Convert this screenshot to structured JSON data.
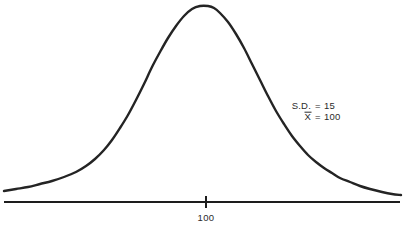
{
  "figure": {
    "ink_color": "#242424",
    "background_color": "#ffffff"
  },
  "annotations": {
    "sd_label": "S.D.",
    "sd_equals": "=",
    "sd_value": "15",
    "mean_symbol": "X",
    "mean_equals": "=",
    "mean_value": "100"
  },
  "axis": {
    "tick_label": "100"
  },
  "chart_data": {
    "type": "line",
    "xlabel": "",
    "ylabel": "",
    "grid": false,
    "legend": null,
    "annotations": [
      "S.D. = 15",
      "X̄ = 100"
    ],
    "axis_ticks": [
      {
        "label": "100",
        "x_px": 206
      }
    ],
    "mean": 100,
    "std_dev": 15,
    "xlim": [
      36,
      166
    ],
    "x": [
      36,
      42,
      48,
      54,
      60,
      66,
      72,
      76,
      80,
      84,
      88,
      91,
      94,
      97,
      100,
      103,
      106,
      109,
      112,
      116,
      120,
      124,
      128,
      134,
      140,
      146,
      152,
      158,
      166
    ],
    "values": [
      0.035,
      0.045,
      0.06,
      0.08,
      0.105,
      0.145,
      0.215,
      0.285,
      0.39,
      0.53,
      0.7,
      0.83,
      0.935,
      0.99,
      1.0,
      0.985,
      0.93,
      0.83,
      0.7,
      0.54,
      0.39,
      0.285,
      0.215,
      0.145,
      0.105,
      0.08,
      0.06,
      0.048,
      0.038
    ],
    "ylim": [
      0,
      1.05
    ],
    "curve_points_px": [
      [
        4,
        191
      ],
      [
        16,
        189
      ],
      [
        28,
        187
      ],
      [
        40,
        184
      ],
      [
        52,
        181
      ],
      [
        64,
        177
      ],
      [
        76,
        172
      ],
      [
        86,
        166
      ],
      [
        95,
        159
      ],
      [
        104,
        150
      ],
      [
        112,
        140
      ],
      [
        120,
        128
      ],
      [
        128,
        115
      ],
      [
        136,
        100
      ],
      [
        144,
        84
      ],
      [
        152,
        67
      ],
      [
        160,
        52
      ],
      [
        168,
        38
      ],
      [
        176,
        26
      ],
      [
        184,
        16
      ],
      [
        192,
        9
      ],
      [
        200,
        6
      ],
      [
        208,
        6
      ],
      [
        214,
        8
      ],
      [
        220,
        13
      ],
      [
        228,
        22
      ],
      [
        236,
        34
      ],
      [
        244,
        48
      ],
      [
        252,
        64
      ],
      [
        260,
        80
      ],
      [
        268,
        96
      ],
      [
        276,
        111
      ],
      [
        284,
        124
      ],
      [
        292,
        136
      ],
      [
        300,
        146
      ],
      [
        308,
        155
      ],
      [
        316,
        162
      ],
      [
        324,
        168
      ],
      [
        332,
        173
      ],
      [
        340,
        178
      ],
      [
        350,
        182
      ],
      [
        360,
        186
      ],
      [
        370,
        189
      ],
      [
        382,
        192
      ],
      [
        392,
        194
      ],
      [
        401,
        195
      ]
    ],
    "baseline_px": {
      "x1": 4,
      "y1": 202,
      "x2": 400,
      "y2": 202
    }
  }
}
